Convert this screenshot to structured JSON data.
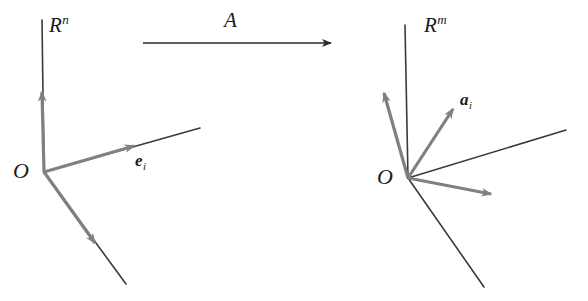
{
  "figure": {
    "background_color": "#ffffff",
    "thin_line_color": "#3a3a3a",
    "vector_color": "#808080",
    "text_color": "#1a1a1a",
    "width": 588,
    "height": 301
  },
  "labels": {
    "domain_space": {
      "base": "R",
      "exponent": "n"
    },
    "codomain_space": {
      "base": "R",
      "exponent": "m"
    },
    "origin_left": "O",
    "origin_right": "O",
    "map": "A",
    "basis_vector": {
      "base": "e",
      "index": "i"
    },
    "image_vector": {
      "base": "a",
      "index": "i"
    }
  },
  "left_panel": {
    "origin": {
      "x": 44,
      "y": 172
    },
    "axes": [
      {
        "name": "vertical-axis",
        "from": [
          42,
          20
        ],
        "to": [
          44,
          172
        ]
      },
      {
        "name": "right-axis",
        "from": [
          44,
          172
        ],
        "to": [
          200,
          128
        ]
      },
      {
        "name": "lower-axis",
        "from": [
          44,
          172
        ],
        "to": [
          126,
          284
        ]
      }
    ],
    "vectors": [
      {
        "name": "vertical-unit-vector",
        "from": [
          44,
          172
        ],
        "to": [
          42,
          86
        ]
      },
      {
        "name": "basis-vector-e-i",
        "from": [
          44,
          172
        ],
        "to": [
          140,
          144
        ]
      },
      {
        "name": "lower-unit-vector",
        "from": [
          44,
          172
        ],
        "to": [
          100,
          250
        ]
      }
    ]
  },
  "map_arrow": {
    "name": "transformation-arrow",
    "from": [
      143,
      43
    ],
    "to": [
      333,
      43
    ]
  },
  "right_panel": {
    "origin": {
      "x": 408,
      "y": 178
    },
    "axes": [
      {
        "name": "vertical-axis",
        "from": [
          405,
          25
        ],
        "to": [
          408,
          178
        ]
      },
      {
        "name": "upper-right-axis",
        "from": [
          408,
          178
        ],
        "to": [
          566,
          130
        ]
      },
      {
        "name": "lower-right-axis",
        "from": [
          408,
          178
        ],
        "to": [
          484,
          287
        ]
      }
    ],
    "vectors": [
      {
        "name": "image-vector-upper-left",
        "from": [
          408,
          178
        ],
        "to": [
          382,
          86
        ]
      },
      {
        "name": "image-vector-a-i",
        "from": [
          408,
          178
        ],
        "to": [
          457,
          103
        ]
      },
      {
        "name": "image-vector-right",
        "from": [
          408,
          178
        ],
        "to": [
          498,
          197
        ]
      }
    ]
  }
}
